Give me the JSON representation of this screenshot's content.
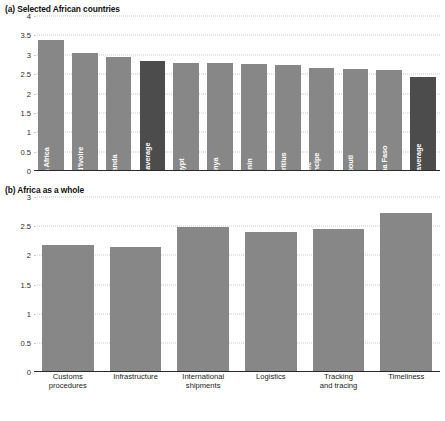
{
  "figure": {
    "panels": [
      {
        "id": "a",
        "title": "(a) Selected African countries"
      },
      {
        "id": "b",
        "title": "(b) Africa as a whole"
      }
    ]
  },
  "colors": {
    "bar": "#878787",
    "bar_highlight": "#4c4c4c",
    "axis": "#2a2a2a",
    "grid": "#c8c8c8",
    "text": "#1a1a1a",
    "bar_label": "#ffffff"
  },
  "chart_data": [
    {
      "type": "bar",
      "title": "(a) Selected African countries",
      "xlabel": "",
      "ylabel": "",
      "ylim": [
        0,
        4
      ],
      "yticks": [
        "0",
        "0.5",
        "1",
        "1.5",
        "2",
        "2.5",
        "3",
        "3.5",
        "4"
      ],
      "ytick_values": [
        0,
        0.5,
        1,
        1.5,
        2,
        2.5,
        3,
        3.5,
        4
      ],
      "grid": true,
      "legend": "none",
      "labels_inside_bars": true,
      "categories": [
        "South Africa",
        "Côte d'Ivoire",
        "Rwanda",
        "Global average",
        "Egypt",
        "Kenya",
        "Benin",
        "Mauritius",
        "Sao Tome and Principe",
        "Djibouti",
        "Burkina Faso",
        "Africa average"
      ],
      "values": [
        3.38,
        3.05,
        2.95,
        2.85,
        2.8,
        2.78,
        2.76,
        2.74,
        2.66,
        2.62,
        2.6,
        2.42
      ],
      "highlighted": [
        "Global average",
        "Africa average"
      ]
    },
    {
      "type": "bar",
      "title": "(b) Africa as a whole",
      "xlabel": "",
      "ylabel": "",
      "ylim": [
        0,
        3
      ],
      "yticks": [
        "0",
        "0.5",
        "1",
        "1.5",
        "2",
        "2.5",
        "3"
      ],
      "ytick_values": [
        0,
        0.5,
        1,
        1.5,
        2,
        2.5,
        3
      ],
      "grid": true,
      "legend": "none",
      "labels_inside_bars": false,
      "categories": [
        "Customs procedures",
        "Infrastructure",
        "International shipments",
        "Logistics",
        "Tracking and tracing",
        "Timeliness"
      ],
      "category_lines": [
        [
          "Customs",
          "procedures"
        ],
        [
          "Infrastructure"
        ],
        [
          "International",
          "shipments"
        ],
        [
          "Logistics"
        ],
        [
          "Tracking",
          "and tracing"
        ],
        [
          "Timeliness"
        ]
      ],
      "values": [
        2.18,
        2.14,
        2.48,
        2.4,
        2.46,
        2.72
      ]
    }
  ]
}
